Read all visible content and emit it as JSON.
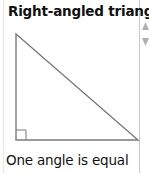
{
  "card": {
    "title": "Right-angled triangle",
    "caption": "One angle is equal",
    "figure": {
      "shape": "right-triangle",
      "right_angle_marker": true,
      "stroke_color": "#7a7a7a"
    }
  },
  "scroll": {
    "up_icon": "triangle-up-icon",
    "down_icon": "triangle-down-icon"
  }
}
